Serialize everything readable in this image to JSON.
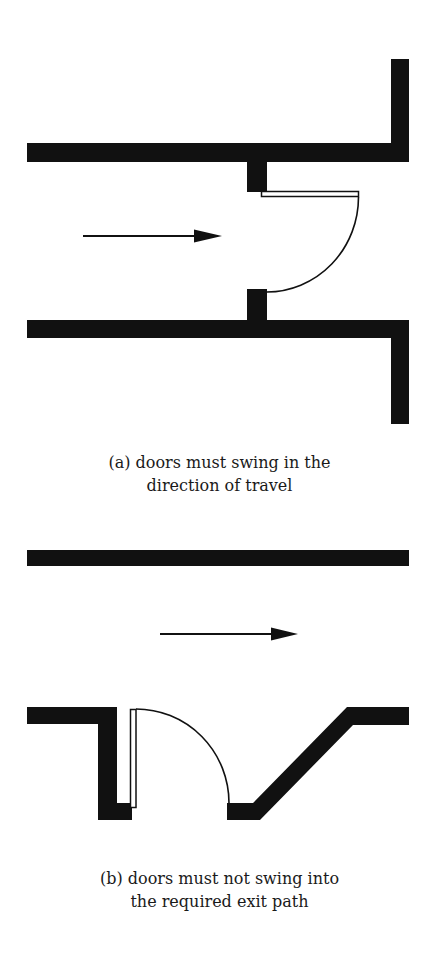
{
  "figure": {
    "colors": {
      "wall": "#111111",
      "line": "#111111",
      "background": "#ffffff"
    },
    "panel_a": {
      "label": "(a)",
      "caption_line1": "(a) doors must swing in the",
      "caption_line2": "direction of travel",
      "elements": [
        "corridor-walls",
        "door-jambs",
        "door-leaf",
        "door-swing-arc",
        "travel-direction-arrow"
      ]
    },
    "panel_b": {
      "label": "(b)",
      "caption_line1": "(b) doors must not swing into",
      "caption_line2": "the required exit path",
      "elements": [
        "corridor-wall-top",
        "door-recess-wall",
        "door-leaf",
        "door-swing-arc",
        "angled-wall",
        "travel-direction-arrow"
      ]
    }
  }
}
